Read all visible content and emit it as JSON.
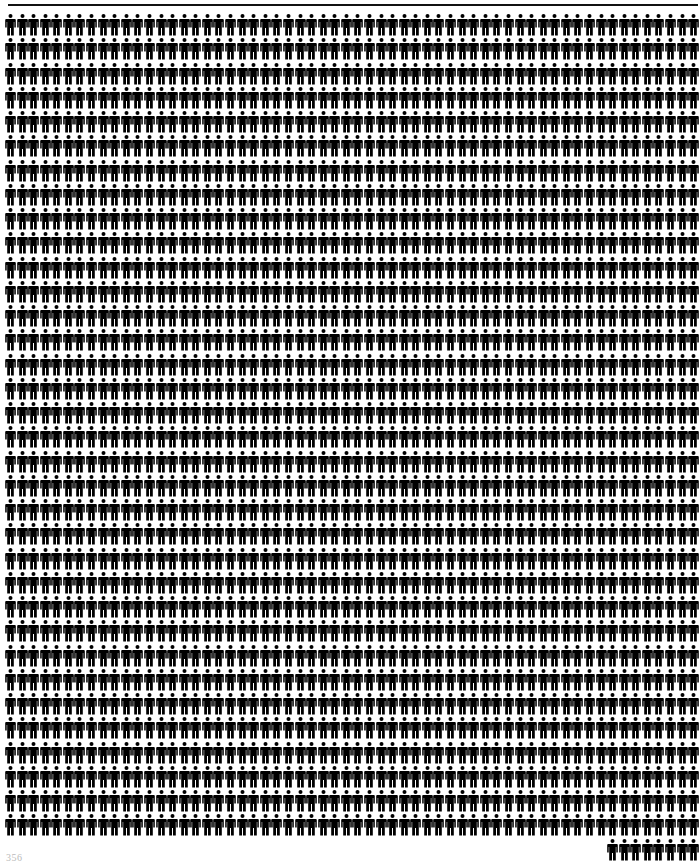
{
  "figure": {
    "icon": "person-icon",
    "color": "#000000",
    "per_row": 60,
    "full_rows": 34,
    "last_row_count": 8,
    "last_row_align": "right",
    "total_figures": 2048,
    "col_pitch_px": 11.58,
    "row_pitch_px": 24.25
  },
  "top_rule": {
    "color": "#111111"
  },
  "footer": {
    "page_number": "356"
  }
}
